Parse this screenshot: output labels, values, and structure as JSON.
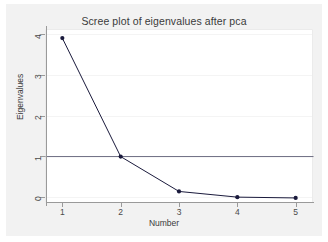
{
  "chart_data": {
    "type": "line",
    "title": "Scree plot of eigenvalues after pca",
    "xlabel": "Number",
    "ylabel": "Eigenvalues",
    "x": [
      1,
      2,
      3,
      4,
      5
    ],
    "values": [
      3.92,
      1.0,
      0.14,
      0.0,
      -0.02
    ],
    "series": [
      {
        "name": "eigenvalues",
        "values": [
          3.92,
          1.0,
          0.14,
          0.0,
          -0.02
        ],
        "color": "#1a1a3c",
        "marker": "filled-circle"
      }
    ],
    "reference_line": {
      "name": "eigenvalue-one-line",
      "orientation": "horizontal",
      "y": 1.0,
      "color": "#6b6b80"
    },
    "xlim": [
      0.72,
      5.28
    ],
    "ylim": [
      -0.12,
      4.12
    ],
    "xticks": [
      1,
      2,
      3,
      4,
      5
    ],
    "xticklabels": [
      "1",
      "2",
      "3",
      "4",
      "5"
    ],
    "yticks": [
      0,
      1,
      2,
      3,
      4
    ],
    "yticklabels": [
      "0",
      "1",
      "2",
      "3",
      "4"
    ],
    "grid": true,
    "grid_axis": "y",
    "legend": "none",
    "plot_background": "#ffffff",
    "canvas_background": "#f2f2f2",
    "axis_color": "#9a9a9a"
  }
}
